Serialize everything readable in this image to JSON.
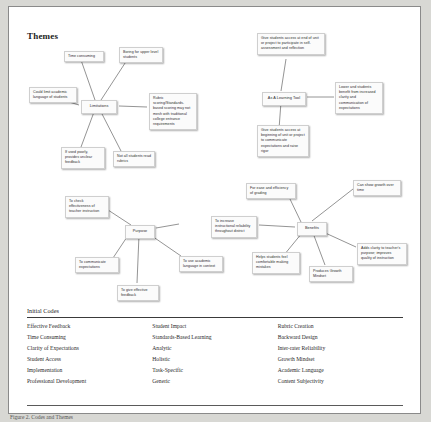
{
  "page": {
    "title": "Themes",
    "caption": "Figure 2. Codes and Themes"
  },
  "clusters": [
    {
      "id": "limitations",
      "center": "Limitations",
      "satellites": [
        "Time consuming",
        "Boring for upper level students",
        "Could limit academic language of students",
        "Rubric scoring/Standards-based scoring may not mesh with traditional college entrance requirements",
        "If used poorly, provides unclear feedback",
        "Not all students read rubrics"
      ]
    },
    {
      "id": "learning-tool",
      "center": "As A Learning Tool",
      "satellites": [
        "Give students access at end of unit or project to participate in self-assessment and reflection",
        "Lower and students benefit from increased clarity and communication of expectations",
        "Give students access at beginning of unit or project to communicate expectations and raise rigor"
      ]
    },
    {
      "id": "purpose",
      "center": "Purpose",
      "satellites": [
        "To check effectiveness of teacher instruction",
        "To communicate expectations",
        "To give effective feedback",
        "To use academic language in context",
        "To increase instructional reliability throughout district"
      ]
    },
    {
      "id": "benefits",
      "center": "Benefits",
      "satellites": [
        "For ease and efficiency of grading",
        "Can show growth over time",
        "Adds clarity to teacher's purpose; improves quality of instruction",
        "Produces Growth Mindset",
        "Helps students feel comfortable making mistakes"
      ]
    }
  ],
  "codes_table": {
    "title": "Initial Codes",
    "columns": [
      [
        "Effective Feedback",
        "Time Consuming",
        "Clarity of Expectations",
        "Student Access",
        "Implementation",
        "Professional Development"
      ],
      [
        "Student Impact",
        "Standards-Based Learning",
        "Analytic",
        "Holistic",
        "Task-Specific",
        "Generic"
      ],
      [
        "Rubric Creation",
        "Backward Design",
        "Inter-rater Reliability",
        "Growth Mindset",
        "Academic Language",
        "Content Subjectivity"
      ]
    ]
  },
  "nodes": {
    "lim_center": {
      "text": "Limitations",
      "left": 72,
      "top": 93,
      "width": 36
    },
    "lim_time": {
      "text": "Time consuming",
      "left": 55,
      "top": 44,
      "width": 40
    },
    "lim_boring": {
      "text": "Boring for upper level students",
      "left": 110,
      "top": 40,
      "width": 44
    },
    "lim_lang": {
      "text": "Could limit academic language of students",
      "left": 20,
      "top": 80,
      "width": 48
    },
    "lim_rubric": {
      "text": "Rubric scoring/Standards-based scoring may not mesh with traditional college entrance requirements",
      "left": 140,
      "top": 86,
      "width": 48
    },
    "lim_poorly": {
      "text": "If used poorly, provides unclear feedback",
      "left": 52,
      "top": 140,
      "width": 44
    },
    "lim_read": {
      "text": "Not all students read rubrics",
      "left": 104,
      "top": 144,
      "width": 42
    },
    "lt_center": {
      "text": "As A Learning Tool",
      "left": 253,
      "top": 85,
      "width": 44
    },
    "lt_end": {
      "text": "Give students access at end of unit or project to participate in self-assessment and reflection",
      "left": 248,
      "top": 26,
      "width": 68
    },
    "lt_lower": {
      "text": "Lower and students benefit from increased clarity and communication of expectations",
      "left": 326,
      "top": 75,
      "width": 48
    },
    "lt_begin": {
      "text": "Give students access at beginning of unit or project to communicate expectations and raise rigor",
      "left": 248,
      "top": 118,
      "width": 52
    },
    "pur_center": {
      "text": "Purpose",
      "left": 116,
      "top": 218,
      "width": 30
    },
    "pur_check": {
      "text": "To check effectiveness of teacher instruction",
      "left": 56,
      "top": 189,
      "width": 44
    },
    "pur_comm": {
      "text": "To communicate expectations",
      "left": 66,
      "top": 250,
      "width": 44
    },
    "pur_give": {
      "text": "To give effective feedback",
      "left": 108,
      "top": 278,
      "width": 42
    },
    "pur_acad": {
      "text": "To use academic language in context",
      "left": 170,
      "top": 249,
      "width": 44
    },
    "ben_center": {
      "text": "Benefits",
      "left": 288,
      "top": 215,
      "width": 30
    },
    "ben_incr": {
      "text": "To increase instructional reliability throughout district",
      "left": 202,
      "top": 209,
      "width": 46
    },
    "ben_ease": {
      "text": "For ease and efficiency of grading",
      "left": 237,
      "top": 176,
      "width": 50
    },
    "ben_growth": {
      "text": "Can show growth over time",
      "left": 344,
      "top": 173,
      "width": 48
    },
    "ben_clarity": {
      "text": "Adds clarity to teacher's purpose; improves quality of instruction",
      "left": 348,
      "top": 236,
      "width": 50
    },
    "ben_mindset": {
      "text": "Produces Growth Mindset",
      "left": 300,
      "top": 259,
      "width": 44
    },
    "ben_helps": {
      "text": "Helps students feel comfortable making mistakes",
      "left": 243,
      "top": 245,
      "width": 48
    }
  }
}
